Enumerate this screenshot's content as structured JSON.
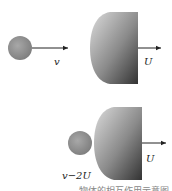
{
  "diagram": {
    "top": {
      "ball_velocity_label": "v",
      "body_velocity_label": "U"
    },
    "bottom": {
      "ball_velocity_label": "v−2U",
      "body_velocity_label": "U"
    },
    "caption": "…物体的相互作用示意图"
  },
  "colors": {
    "ball": "#8c8c8c",
    "body_light": "#d0d0d0",
    "body_dark": "#3a3a3a",
    "arrow": "#222222"
  }
}
